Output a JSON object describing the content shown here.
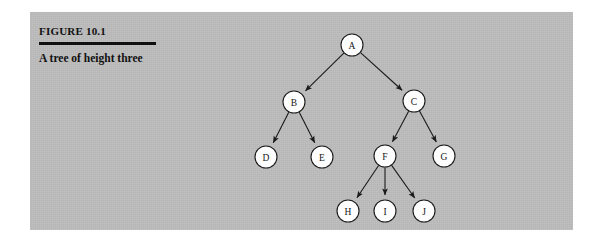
{
  "figure": {
    "number_label": "FIGURE 10.1",
    "caption": "A tree of height three",
    "panel_color": "#bcbcbc",
    "rule_color": "#101010",
    "text_color": "#111111"
  },
  "tree": {
    "node_radius": 11,
    "node_fill": "#fdfdfd",
    "node_stroke": "#1a1a1a",
    "edge_color": "#1a1a1a",
    "nodes": [
      {
        "id": "A",
        "label": "A",
        "x": 322,
        "y": 33
      },
      {
        "id": "B",
        "label": "B",
        "x": 264,
        "y": 90
      },
      {
        "id": "C",
        "label": "C",
        "x": 384,
        "y": 89
      },
      {
        "id": "D",
        "label": "D",
        "x": 236,
        "y": 145
      },
      {
        "id": "E",
        "label": "E",
        "x": 292,
        "y": 145
      },
      {
        "id": "F",
        "label": "F",
        "x": 355,
        "y": 144
      },
      {
        "id": "G",
        "label": "G",
        "x": 414,
        "y": 144
      },
      {
        "id": "H",
        "label": "H",
        "x": 318,
        "y": 199
      },
      {
        "id": "I",
        "label": "I",
        "x": 355,
        "y": 199
      },
      {
        "id": "J",
        "label": "J",
        "x": 394,
        "y": 199
      }
    ],
    "edges": [
      {
        "from": "A",
        "to": "B"
      },
      {
        "from": "A",
        "to": "C"
      },
      {
        "from": "B",
        "to": "D"
      },
      {
        "from": "B",
        "to": "E"
      },
      {
        "from": "C",
        "to": "F"
      },
      {
        "from": "C",
        "to": "G"
      },
      {
        "from": "F",
        "to": "H"
      },
      {
        "from": "F",
        "to": "I"
      },
      {
        "from": "F",
        "to": "J"
      }
    ]
  }
}
